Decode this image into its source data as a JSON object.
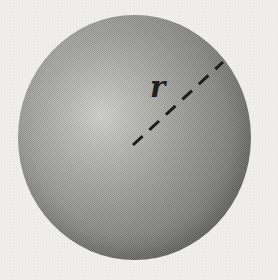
{
  "figure": {
    "radius_label": "r"
  },
  "colors": {
    "background": "#f0efeb",
    "sphere_highlight": "#d8d8d4",
    "sphere_mid": "#9b9b97",
    "sphere_edge": "#727270",
    "line": "#1c1c1a",
    "label": "#1e1e1c"
  }
}
